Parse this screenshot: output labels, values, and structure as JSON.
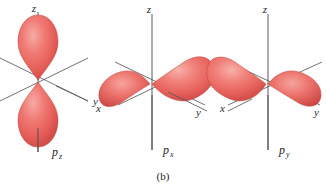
{
  "figure": {
    "caption": "(b)",
    "background_color": "#fefefe",
    "lobe_color": "#e8615c",
    "lobe_color_light": "#f5a09a",
    "lobe_color_dark": "#c9423f",
    "axis_color": "#4a4a4a",
    "text_color": "#1f1f1f"
  },
  "orbitals": [
    {
      "name": "p-z-orbital",
      "label_base": "p",
      "label_sub": "z",
      "label_full": "pz",
      "orientation": "vertical",
      "axes": [
        {
          "name": "z",
          "label": "z",
          "direction": "up"
        },
        {
          "name": "y",
          "label": "y",
          "direction": "lower-right"
        },
        {
          "name": "x",
          "label": "",
          "direction": "lower-left"
        }
      ],
      "lobe_count": 2,
      "lobe_axis": "z"
    },
    {
      "name": "p-x-orbital",
      "label_base": "p",
      "label_sub": "x",
      "label_full": "px",
      "orientation": "x-axis",
      "axes": [
        {
          "name": "z",
          "label": "z",
          "direction": "up"
        },
        {
          "name": "y",
          "label": "y",
          "direction": "lower-right"
        },
        {
          "name": "x",
          "label": "x",
          "direction": "lower-left"
        }
      ],
      "lobe_count": 2,
      "lobe_axis": "x"
    },
    {
      "name": "p-y-orbital",
      "label_base": "p",
      "label_sub": "y",
      "label_full": "py",
      "orientation": "y-axis",
      "axes": [
        {
          "name": "z",
          "label": "z",
          "direction": "up"
        },
        {
          "name": "y",
          "label": "y",
          "direction": "lower-right"
        },
        {
          "name": "x",
          "label": "x",
          "direction": "lower-left"
        }
      ],
      "lobe_count": 2,
      "lobe_axis": "y"
    }
  ]
}
